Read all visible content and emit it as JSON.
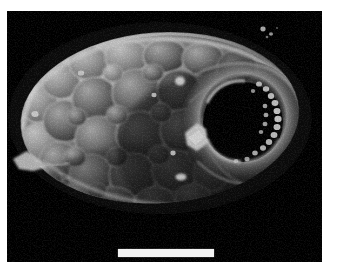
{
  "figure": {
    "kind": "sem-micrograph",
    "modality": "Scanning electron microscopy",
    "color_mode": "grayscale",
    "caption": ""
  },
  "plate": {
    "background_color": "#000000",
    "page_color": "#ffffff",
    "x": 7,
    "y": 11,
    "width": 315,
    "height": 251
  },
  "scale_bar": {
    "label": "",
    "x": 111,
    "y": 238,
    "width": 96,
    "height": 8,
    "color": "#f2f2f2"
  },
  "specimen": {
    "name": "ovoid-body",
    "center_x": 160,
    "center_y": 118,
    "radius_x": 140,
    "radius_y": 86,
    "rotation_deg": -4,
    "highlight_color": "#f0f0f0",
    "midtone_color": "#8a8a8a",
    "shadow_color": "#2a2a2a"
  },
  "aperture": {
    "name": "terminal-aperture",
    "center_x": 243,
    "center_y": 122,
    "radius_x": 40,
    "radius_y": 40,
    "fill_color": "#030303",
    "rim_color": "#d8d8d8"
  },
  "papillae": {
    "name": "aperture-papillae",
    "count": 18,
    "color": "#ededed",
    "arc_start_deg": -70,
    "arc_end_deg": 70
  },
  "globules": {
    "name": "surface-globules",
    "count": 46,
    "min_radius": 9,
    "max_radius": 26,
    "edge_color": "#e6e6e6",
    "fill_color": "#6d6d6d"
  },
  "debris": [
    {
      "name": "left-flake",
      "x": 20,
      "y": 152,
      "w": 22,
      "h": 11
    },
    {
      "name": "upper-speck",
      "x": 169,
      "y": 66,
      "w": 9,
      "h": 9
    },
    {
      "name": "crystal-fragment",
      "x": 185,
      "y": 120,
      "w": 18,
      "h": 18
    },
    {
      "name": "lower-speck",
      "x": 176,
      "y": 167,
      "w": 11,
      "h": 8
    },
    {
      "name": "field-speck-a",
      "x": 263,
      "y": 28,
      "w": 5,
      "h": 5
    },
    {
      "name": "field-speck-b",
      "x": 271,
      "y": 33,
      "w": 4,
      "h": 4
    },
    {
      "name": "mid-speck",
      "x": 172,
      "y": 145,
      "w": 5,
      "h": 5
    },
    {
      "name": "rim-speck",
      "x": 153,
      "y": 86,
      "w": 5,
      "h": 4
    }
  ]
}
